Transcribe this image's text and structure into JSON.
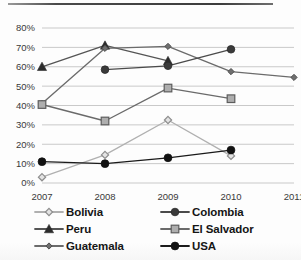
{
  "chart_data": {
    "type": "line",
    "title": "",
    "subtitle": "",
    "xlabel": "",
    "ylabel": "",
    "x": [
      "2007",
      "2008",
      "2009",
      "2010",
      "2011"
    ],
    "xtick_labels": [
      "2007",
      "2008",
      "2009",
      "2010",
      "2011"
    ],
    "ytick_labels": [
      "0%",
      "10%",
      "20%",
      "30%",
      "40%",
      "50%",
      "60%",
      "70%",
      "80%"
    ],
    "ytick_values": [
      0,
      10,
      20,
      30,
      40,
      50,
      60,
      70,
      80
    ],
    "ylim": [
      0,
      80
    ],
    "grid": "horizontal",
    "legend_position": "bottom",
    "legend_columns": 2,
    "series": [
      {
        "name": "Bolivia",
        "marker": "open-diamond",
        "color": "#b4b4b4",
        "line_color": "#b0b0b0",
        "values": [
          3,
          14.5,
          32.5,
          14,
          null
        ]
      },
      {
        "name": "Peru",
        "marker": "filled-triangle",
        "color": "#2b2b2b",
        "line_color": "#555555",
        "values": [
          60,
          71,
          63,
          null,
          null
        ]
      },
      {
        "name": "Guatemala",
        "marker": "small-diamond",
        "color": "#6f6f6f",
        "line_color": "#6b6b6b",
        "values": [
          41,
          69.5,
          70.5,
          57.5,
          54.5
        ]
      },
      {
        "name": "Colombia",
        "marker": "filled-circle",
        "color": "#3a3a3a",
        "line_color": "#4a4a4a",
        "values": [
          null,
          58.5,
          60.5,
          69,
          null
        ]
      },
      {
        "name": "El Salvador",
        "marker": "open-square",
        "color": "#9a9a9a",
        "line_color": "#6a6a6a",
        "values": [
          40.5,
          32,
          49,
          43.5,
          null
        ]
      },
      {
        "name": "USA",
        "marker": "filled-circle-black",
        "color": "#111111",
        "line_color": "#1a1a1a",
        "values": [
          11,
          10,
          13,
          17,
          null
        ]
      }
    ],
    "legend_order": [
      [
        "Bolivia",
        "Colombia"
      ],
      [
        "Peru",
        "El Salvador"
      ],
      [
        "Guatemala",
        "USA"
      ]
    ]
  },
  "legend": {
    "column_a": [
      {
        "label": "Bolivia",
        "series_index": 0
      },
      {
        "label": "Peru",
        "series_index": 1
      },
      {
        "label": "Guatemala",
        "series_index": 2
      }
    ],
    "column_b": [
      {
        "label": "Colombia",
        "series_index": 3
      },
      {
        "label": "El Salvador",
        "series_index": 4
      },
      {
        "label": "USA",
        "series_index": 5
      }
    ]
  },
  "colors": {
    "grid": "#c9c9c9",
    "axis_text": "#3a3a3a",
    "background": "#fdfdfd",
    "top_rule": "#3c3c3c"
  }
}
